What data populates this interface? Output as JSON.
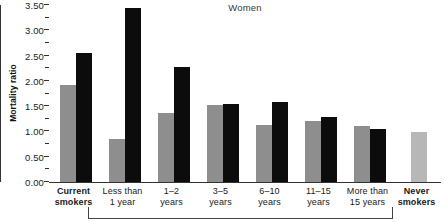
{
  "chart_data": {
    "type": "bar",
    "title": "Women",
    "xlabel": "",
    "ylabel": "Mortality ratio",
    "ylim": [
      0.0,
      3.5
    ],
    "ytick_labels": [
      "0.00",
      "0.50",
      "1.00",
      "1.50",
      "2.00",
      "2.50",
      "3.00",
      "3.50"
    ],
    "ytick_values": [
      0.0,
      0.5,
      1.0,
      1.5,
      2.0,
      2.5,
      3.0,
      3.5
    ],
    "minor_tick_values": [
      0.25,
      0.75,
      1.25,
      1.75,
      2.25,
      2.75,
      3.25
    ],
    "grid": false,
    "legend": "none",
    "categories": [
      {
        "id": "current-smokers",
        "line1": "Current",
        "line2": "smokers",
        "bold": true
      },
      {
        "id": "less-than-1-year",
        "line1": "Less than",
        "line2": "1 year",
        "bold": false
      },
      {
        "id": "1-2-years",
        "line1": "1–2",
        "line2": "years",
        "bold": false
      },
      {
        "id": "3-5-years",
        "line1": "3–5",
        "line2": "years",
        "bold": false
      },
      {
        "id": "6-10-years",
        "line1": "6–10",
        "line2": "years",
        "bold": false
      },
      {
        "id": "11-15-years",
        "line1": "11–15",
        "line2": "years",
        "bold": false
      },
      {
        "id": "more-than-15-years",
        "line1": "More than",
        "line2": "15 years",
        "bold": false
      },
      {
        "id": "never-smokers",
        "line1": "Never",
        "line2": "smokers",
        "bold": true
      }
    ],
    "series": [
      {
        "name": "series-gray",
        "color": "#8e8e8e",
        "values": [
          1.92,
          0.85,
          1.37,
          1.52,
          1.12,
          1.2,
          1.1,
          null
        ]
      },
      {
        "name": "series-black",
        "color": "#0c0c0c",
        "values": [
          2.56,
          3.44,
          2.27,
          1.55,
          1.58,
          1.29,
          1.04,
          null
        ]
      },
      {
        "name": "series-reference",
        "color": "#b7b7b7",
        "values": [
          null,
          null,
          null,
          null,
          null,
          null,
          null,
          0.99
        ]
      }
    ]
  },
  "colors": {
    "gray": "#8e8e8e",
    "black": "#0c0c0c",
    "light_gray": "#b7b7b7",
    "axis": "#333333",
    "background": "#ffffff"
  }
}
